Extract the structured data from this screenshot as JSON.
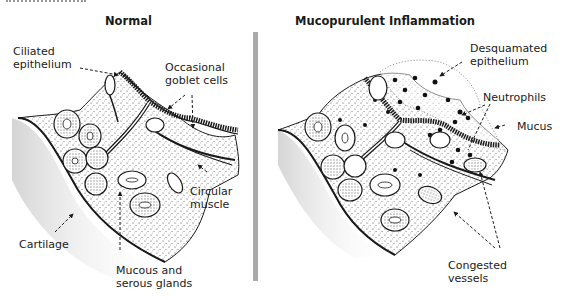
{
  "panels": [
    {
      "title": "Normal",
      "labels": [
        {
          "id": "ciliated-epithelium",
          "text": "Ciliated\nepithelium"
        },
        {
          "id": "occasional-goblet-cells",
          "text": "Occasional\ngoblet cells"
        },
        {
          "id": "circular-muscle",
          "text": "Circular\nmuscle"
        },
        {
          "id": "cartilage",
          "text": "Cartilage"
        },
        {
          "id": "mucous-serous-glands",
          "text": "Mucous and\nserous glands"
        }
      ]
    },
    {
      "title": "Mucopurulent Inflammation",
      "labels": [
        {
          "id": "desquamated-epithelium",
          "text": "Desquamated\nepithelium"
        },
        {
          "id": "neutrophils",
          "text": "Neutrophils"
        },
        {
          "id": "mucus",
          "text": "Mucus"
        },
        {
          "id": "congested-vessels",
          "text": "Congested\nvessels"
        }
      ]
    }
  ],
  "colors": {
    "ink": "#1a1a1a",
    "divider": "#a9a9a9",
    "cartilage_shade": "#d6d6d6",
    "tissue_stipple": "#555555"
  }
}
